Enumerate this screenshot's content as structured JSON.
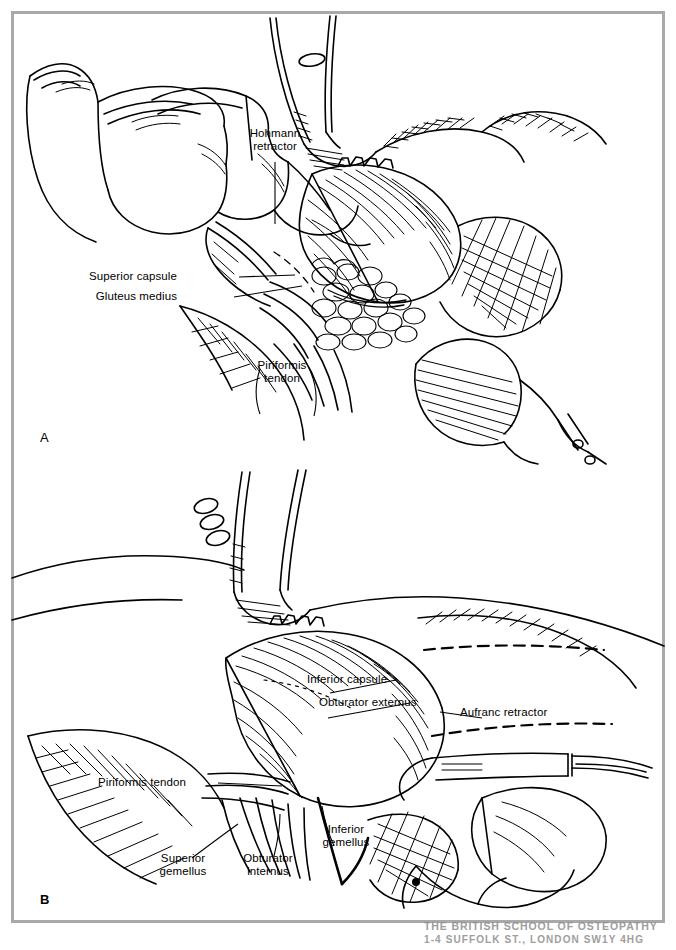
{
  "figure": {
    "kind": "surgical-anatomy-line-drawing",
    "ink_color": "#000000",
    "page_color": "#ffffff",
    "frame_color": "#a9a9a9"
  },
  "panels": [
    {
      "id": "A",
      "letter": "A",
      "letter_bold": false,
      "description": "Surgeon's hand retracting; Hohmann retractor placed over the superior capsule with gluteus medius and piriformis tendon exposed.",
      "labels": [
        {
          "name": "hohmann-retractor",
          "text": "Hohmann\nretractor",
          "align": "center"
        },
        {
          "name": "superior-capsule",
          "text": "Superior capsule",
          "align": "right"
        },
        {
          "name": "gluteus-medius",
          "text": "Gluteus medius",
          "align": "right"
        },
        {
          "name": "piriformis-tendon",
          "text": "Piriformis\ntendon",
          "align": "center"
        }
      ]
    },
    {
      "id": "B",
      "letter": "B",
      "letter_bold": true,
      "description": "Deeper exposure showing inferior capsule, obturator externus and internus, superior and inferior gemelli, piriformis tendon, with an Aufranc retractor in place.",
      "labels": [
        {
          "name": "inferior-capsule",
          "text": "Inferior capsule",
          "align": "left"
        },
        {
          "name": "obturator-externus",
          "text": "Obturator externus",
          "align": "left"
        },
        {
          "name": "aufranc-retractor",
          "text": "Aufranc retractor",
          "align": "left"
        },
        {
          "name": "piriformis-tendon",
          "text": "Piriformis tendon",
          "align": "right"
        },
        {
          "name": "superior-gemellus",
          "text": "Superior\ngemellus",
          "align": "center"
        },
        {
          "name": "obturator-internus",
          "text": "Obturator\ninternus",
          "align": "center"
        },
        {
          "name": "inferior-gemellus",
          "text": "Inferior\ngemellus",
          "align": "center"
        }
      ]
    }
  ],
  "stamp": {
    "line1": "THE BRITISH SCHOOL OF OSTEOPATHY",
    "line2": "1-4 SUFFOLK ST., LONDON SW1Y 4HG"
  }
}
